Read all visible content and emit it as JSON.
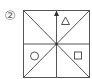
{
  "figure": {
    "label": "②",
    "shapes": {
      "top_right": "triangle",
      "bottom_left": "circle",
      "bottom_right": "square"
    },
    "arrow": {
      "direction": "up",
      "from": "center",
      "to": "top-edge"
    },
    "colors": {
      "stroke": "#555555",
      "background": "#ffffff"
    }
  }
}
